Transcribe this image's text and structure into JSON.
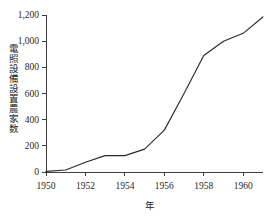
{
  "chart_data": {
    "type": "line",
    "title": "",
    "subtitle": "",
    "xlabel": "年",
    "ylabel": "電照設備設置農家数",
    "ylabel_chars": [
      "電",
      "照",
      "設",
      "備",
      "設",
      "置",
      "農",
      "家",
      "数"
    ],
    "x": [
      1950,
      1951,
      1952,
      1953,
      1954,
      1955,
      1956,
      1957,
      1958,
      1959,
      1960,
      1961
    ],
    "values": [
      5,
      15,
      75,
      125,
      125,
      175,
      320,
      600,
      890,
      1000,
      1060,
      1185
    ],
    "series": [
      {
        "name": "電照設備設置農家数",
        "values": [
          5,
          15,
          75,
          125,
          125,
          175,
          320,
          600,
          890,
          1000,
          1060,
          1185
        ]
      }
    ],
    "xlim": [
      1950,
      1961
    ],
    "ylim": [
      0,
      1200
    ],
    "xticks": [
      1950,
      1952,
      1954,
      1956,
      1958,
      1960
    ],
    "xtick_labels": [
      "1950",
      "1952",
      "1954",
      "1956",
      "1958",
      "1960"
    ],
    "yticks": [
      0,
      200,
      400,
      600,
      800,
      1000,
      1200
    ],
    "ytick_labels": [
      "0",
      "200",
      "400",
      "600",
      "800",
      "1,000",
      "1,200"
    ],
    "grid": false,
    "legend": false,
    "legend_position": "none",
    "line_color": "#2b2b2b",
    "background_color": "#ffffff",
    "axis_color": "#2a2a2a"
  }
}
